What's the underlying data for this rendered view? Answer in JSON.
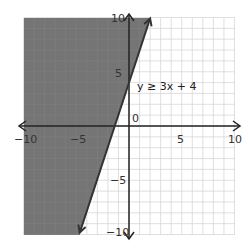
{
  "chart_data": {
    "type": "inequality-graph",
    "title": "",
    "inequality": "y ≥ 3x + 4",
    "boundary": {
      "slope": 3,
      "intercept": 4,
      "style": "solid"
    },
    "shaded_region": "above/left of line",
    "xlim": [
      -10,
      10
    ],
    "ylim": [
      -10,
      10
    ],
    "x_ticks_labeled": [
      -10,
      -5,
      5,
      10
    ],
    "y_ticks_labeled": [
      10,
      5,
      -5,
      -10
    ],
    "origin_label": "0",
    "grid": true,
    "grid_step": 1,
    "colors": {
      "shade": "#6e6e6e",
      "grid": "#d8d8d8",
      "axis": "#222222",
      "line": "#333333"
    }
  },
  "labels": {
    "equation": "y ≥ 3x + 4",
    "origin": "0",
    "x_neg10": "−10",
    "x_neg5": "−5",
    "x_5": "5",
    "x_10": "10",
    "y_10": "10",
    "y_5": "5",
    "y_neg5": "−5",
    "y_neg10": "−10"
  }
}
